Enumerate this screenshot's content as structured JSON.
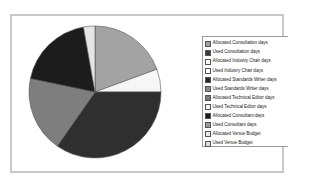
{
  "chart_data": {
    "type": "pie",
    "title": "",
    "legend_position": "right",
    "categories": [
      "Allocated Consultation days",
      "Used Consultation days",
      "Allocated Industry Chair days",
      "Used Industry Chair days",
      "Allocated Standards Writer days",
      "Used Standards Writer days",
      "Allocated Technical Editor days",
      "Used Technical Editor days",
      "Allocated Consultant days",
      "Used Consultant days",
      "Allocated Venue Budget",
      "Used Venue Budget"
    ],
    "legend_colors": [
      "#a0a0a0",
      "#3a3a3a",
      "#ffffff",
      "#ffffff",
      "#2a2a2a",
      "#8c8c8c",
      "#7a7a7a",
      "#f4f4f4",
      "#1a1a1a",
      "#9a9a9a",
      "#eaeaea",
      "#dcdcdc"
    ],
    "visible_slices": [
      {
        "label": "Allocated Consultation days",
        "percent": 19.4,
        "color": "#a3a3a3"
      },
      {
        "label": "Allocated Industry Chair days",
        "percent": 5.6,
        "color": "#f6f6f6"
      },
      {
        "label": "Used Consultation days",
        "percent": 34.7,
        "color": "#2f2f2f"
      },
      {
        "label": "Used Standards Writer days",
        "percent": 18.6,
        "color": "#7e7e7e"
      },
      {
        "label": "Allocated Standards Writer days",
        "percent": 18.9,
        "color": "#1c1c1c"
      },
      {
        "label": "Allocated Venue Budget",
        "percent": 2.8,
        "color": "#e6e6e6"
      }
    ]
  },
  "legend": {
    "items": [
      {
        "label": "Allocated Consultation days",
        "color": "#a0a0a0"
      },
      {
        "label": "Used Consultation days",
        "color": "#3a3a3a"
      },
      {
        "label": "Allocated Industry Chair days",
        "color": "#ffffff"
      },
      {
        "label": "Used Industry Chair days",
        "color": "#ffffff"
      },
      {
        "label": "Allocated Standards Writer days",
        "color": "#2a2a2a"
      },
      {
        "label": "Used Standards Writer days",
        "color": "#8c8c8c"
      },
      {
        "label": "Allocated Technical Editor days",
        "color": "#7a7a7a"
      },
      {
        "label": "Used Technical Editor days",
        "color": "#f4f4f4"
      },
      {
        "label": "Allocated Consultant days",
        "color": "#1a1a1a"
      },
      {
        "label": "Used Consultant days",
        "color": "#9a9a9a"
      },
      {
        "label": "Allocated Venue Budget",
        "color": "#eaeaea"
      },
      {
        "label": "Used Venue Budget",
        "color": "#dcdcdc"
      }
    ]
  }
}
